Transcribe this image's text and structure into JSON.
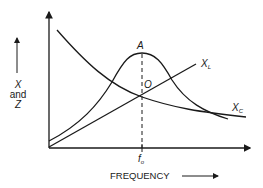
{
  "diagram": {
    "title": "",
    "y_axis": {
      "line1": "X",
      "line2": "and",
      "line3": "Z"
    },
    "x_axis": {
      "label": "FREQUENCY"
    },
    "curves": {
      "inductive_reactance": {
        "label": "X",
        "subscript": "L"
      },
      "capacitive_reactance": {
        "label": "X",
        "subscript": "C"
      }
    },
    "points": {
      "peak": "A",
      "crossover": "O"
    },
    "resonant_frequency": {
      "label": "f",
      "subscript": "o"
    },
    "colors": {
      "line": "#1a1a1a",
      "background": "#ffffff"
    }
  }
}
